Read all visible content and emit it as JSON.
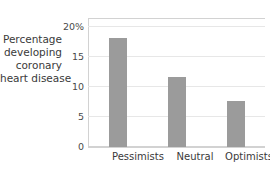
{
  "chart_data": {
    "type": "bar",
    "title": "",
    "subtitle": "",
    "xlabel": "",
    "ylabel": "Percentage developing coronary heart disease",
    "ylabel_lines": [
      "Percentage",
      "developing",
      "coronary",
      "heart disease"
    ],
    "categories": [
      "Pessimists",
      "Neutral",
      "Optimists"
    ],
    "values": [
      18.2,
      11.7,
      7.7
    ],
    "series": [
      {
        "name": "Percentage developing coronary heart disease",
        "values": [
          18.2,
          11.7,
          7.7
        ]
      }
    ],
    "ylim": [
      0,
      20
    ],
    "yticks": [
      0,
      5,
      10,
      15,
      20
    ],
    "ytick_labels": [
      "0",
      "5",
      "10",
      "15",
      "20%"
    ],
    "grid": true,
    "legend": "none",
    "units": "percent",
    "bar_color": "#9b9b9b",
    "grid_color": "#e7e7e7",
    "axis_color": "#d2d2d2",
    "text_color": "#3a3a3a"
  }
}
